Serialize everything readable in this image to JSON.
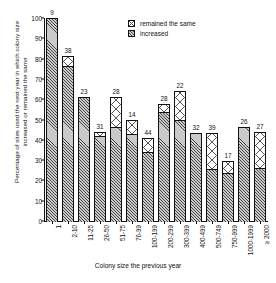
{
  "chart_data": {
    "type": "bar",
    "stacked": true,
    "title": "",
    "xlabel": "Colony size the previous year",
    "ylabel": "Percentage of sites used the next year in which colony size increased or remained the same",
    "categories": [
      "1",
      "2-10",
      "11-25",
      "26-50",
      "51-75",
      "76-99",
      "100-199",
      "200-299",
      "300-399",
      "400-499",
      "500-749",
      "750-999",
      "1000-1999",
      "≥ 2000"
    ],
    "series": [
      {
        "name": "increased",
        "values": [
          100,
          76.5,
          61,
          42,
          46.5,
          43,
          34,
          53.5,
          50,
          43.5,
          25.5,
          23.5,
          46.5,
          26
        ]
      },
      {
        "name": "remained the same",
        "values": [
          0,
          5,
          0,
          2,
          14.5,
          7,
          7,
          4,
          14,
          0,
          18,
          6,
          0,
          18
        ]
      }
    ],
    "totals": [
      100,
      81.5,
      61,
      44,
      61,
      50,
      41,
      57.5,
      64,
      43.5,
      43.5,
      29.5,
      46.5,
      44
    ],
    "bar_labels": [
      "9",
      "38",
      "23",
      "31",
      "28",
      "14",
      "44",
      "28",
      "22",
      "32",
      "39",
      "17",
      "26",
      "27"
    ],
    "bar_label_meaning": "sample size n above each bar",
    "yticks": [
      0,
      10,
      20,
      30,
      40,
      50,
      60,
      70,
      80,
      90,
      100
    ],
    "ylim": [
      0,
      100
    ],
    "grid": false,
    "legend_position": "top-right",
    "legend": [
      {
        "label": "remained the same",
        "pattern": "cross-dot"
      },
      {
        "label": "increased",
        "pattern": "diagonal-hatch"
      }
    ]
  }
}
